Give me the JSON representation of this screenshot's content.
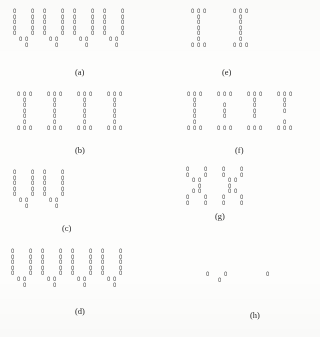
{
  "figure": {
    "glyph": "0",
    "glyph_name": "zero-glyph",
    "background_color": "#fdfdfc",
    "ink_color": "#3b3b3b",
    "cell_width": 6.0,
    "cell_height": 5.6,
    "panels": [
      {
        "id": "a",
        "label": "(a)",
        "label_x": 75,
        "label_y": 68,
        "origin_x": 13,
        "origin_y": 9,
        "shape": "four-U-letters",
        "rows": [
          "0  0 0  0 0  0 0  0",
          "0  0 0  0 0  0 0  0",
          "0  0 0  0 0  0 0  0",
          "0  0 0  0 0  0 0  0",
          "0  0 0  0 0  0 0  0",
          " 00   00   00   00 ",
          "  0    0    0    0 "
        ]
      },
      {
        "id": "b",
        "label": "(b)",
        "label_x": 75,
        "label_y": 146,
        "origin_x": 17,
        "origin_y": 92,
        "shape": "four-I-letters",
        "rows": [
          "000  000  000  000",
          " 0    0    0    0 ",
          " 0    0    0    0 ",
          " 0    0    0    0 ",
          " 0    0    0    0 ",
          " 0    0    0    0 ",
          "000  000  000  000"
        ]
      },
      {
        "id": "c",
        "label": "(c)",
        "label_x": 62,
        "label_y": 224,
        "origin_x": 13,
        "origin_y": 170,
        "shape": "two-U-letters",
        "rows": [
          "0  0 0  0",
          "0  0 0  0",
          "0  0 0  0",
          "0  0 0  0",
          "0  0 0  0",
          " 00   00 ",
          "  0    0 "
        ]
      },
      {
        "id": "d",
        "label": "(d)",
        "label_x": 75,
        "label_y": 307,
        "origin_x": 11,
        "origin_y": 249,
        "shape": "four-U-letters",
        "rows": [
          "0  0 0  0 0  0 0  0",
          "0  0 0  0 0  0 0  0",
          "0  0 0  0 0  0 0  0",
          "0  0 0  0 0  0 0  0",
          "0  0 0  0 0  0 0  0",
          " 00   00   00   00 ",
          "  0    0    0    0 "
        ]
      },
      {
        "id": "e",
        "label": "(e)",
        "label_x": 222,
        "label_y": 68,
        "origin_x": 191,
        "origin_y": 9,
        "shape": "two-I-letters",
        "rows": [
          "000    000",
          " 0      0 ",
          " 0      0 ",
          " 0      0 ",
          " 0      0 ",
          " 0      0 ",
          "000    000"
        ]
      },
      {
        "id": "f",
        "label": "(f)",
        "label_x": 235,
        "label_y": 146,
        "origin_x": 187,
        "origin_y": 92,
        "shape": "four-I-letters",
        "rows": [
          "000  000  000  000",
          " 0         0    0 ",
          " 0    0    0    0 ",
          " 0    0    0    0 ",
          " 0    0    0      ",
          " 0              0 ",
          "000  000  000  000"
        ]
      },
      {
        "id": "g",
        "label": "(g)",
        "label_x": 215,
        "label_y": 212,
        "origin_x": 186,
        "origin_y": 167,
        "shape": "two-X-letters",
        "rows": [
          "0  0  0  0",
          "0  0  0  0",
          " 00    00 ",
          "  0    0  ",
          " 00    00 ",
          "0  0  0  0",
          "0  0  0  0"
        ]
      },
      {
        "id": "h",
        "label": "(h)",
        "label_x": 250,
        "label_y": 311,
        "origin_x": 206,
        "origin_y": 272,
        "shape": "sparse-residual",
        "rows": [
          "0  0      0",
          "  0        "
        ]
      }
    ]
  }
}
